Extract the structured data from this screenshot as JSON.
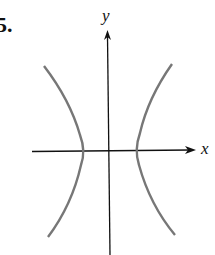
{
  "problem_number": "5.",
  "axes": {
    "x_label": "x",
    "y_label": "y"
  },
  "colors": {
    "axis": "#111111",
    "curve": "#777777"
  },
  "figure": {
    "type": "hyperbola"
  }
}
